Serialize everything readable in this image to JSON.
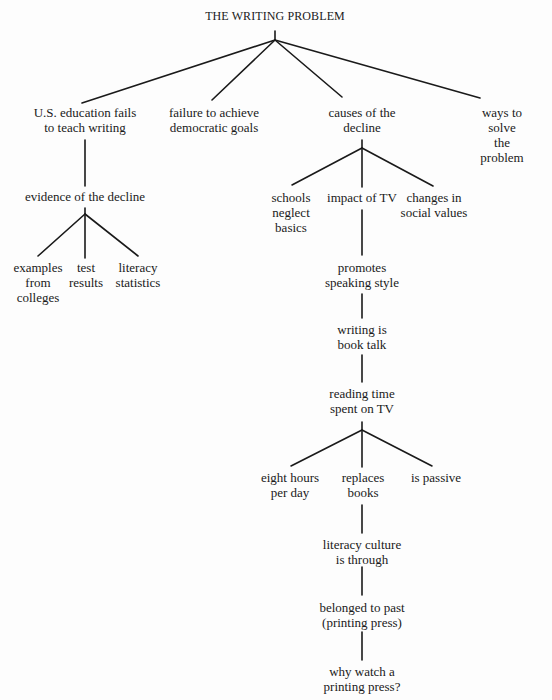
{
  "diagram": {
    "type": "tree",
    "title": "THE WRITING PROBLEM",
    "nodes": {
      "root": "THE WRITING PROBLEM",
      "education_fails": "U.S. education fails\nto teach writing",
      "democratic_goals": "failure to achieve\ndemocratic goals",
      "causes": "causes of the\ndecline",
      "ways_to_solve": "ways to solve\nthe problem",
      "evidence": "evidence of the decline",
      "examples": "examples\nfrom\ncolleges",
      "test_results": "test\nresults",
      "literacy_stats": "literacy\nstatistics",
      "schools_neglect": "schools\nneglect\nbasics",
      "impact_tv": "impact of TV",
      "social_values": "changes in\nsocial values",
      "speaking_style": "promotes\nspeaking style",
      "book_talk": "writing is\nbook talk",
      "reading_time": "reading time\nspent on TV",
      "eight_hours": "eight hours\nper day",
      "replaces_books": "replaces\nbooks",
      "is_passive": "is passive",
      "literacy_culture": "literacy culture\nis through",
      "belonged_past": "belonged to past\n(printing press)",
      "printing_press": "why watch a\nprinting press?"
    },
    "edges": [
      [
        "root",
        "education_fails"
      ],
      [
        "root",
        "democratic_goals"
      ],
      [
        "root",
        "causes"
      ],
      [
        "root",
        "ways_to_solve"
      ],
      [
        "education_fails",
        "evidence"
      ],
      [
        "evidence",
        "examples"
      ],
      [
        "evidence",
        "test_results"
      ],
      [
        "evidence",
        "literacy_stats"
      ],
      [
        "causes",
        "schools_neglect"
      ],
      [
        "causes",
        "impact_tv"
      ],
      [
        "causes",
        "social_values"
      ],
      [
        "impact_tv",
        "speaking_style"
      ],
      [
        "speaking_style",
        "book_talk"
      ],
      [
        "book_talk",
        "reading_time"
      ],
      [
        "reading_time",
        "eight_hours"
      ],
      [
        "reading_time",
        "replaces_books"
      ],
      [
        "reading_time",
        "is_passive"
      ],
      [
        "replaces_books",
        "literacy_culture"
      ],
      [
        "literacy_culture",
        "belonged_past"
      ],
      [
        "belonged_past",
        "printing_press"
      ]
    ]
  }
}
